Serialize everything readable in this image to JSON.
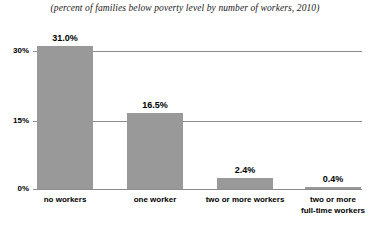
{
  "chart_data": {
    "type": "bar",
    "title": "(percent of families below poverty level by number of workers, 2010)",
    "xlabel": "",
    "ylabel": "",
    "categories": [
      "no workers",
      "one worker",
      "two or more workers",
      "two or more full-time workers"
    ],
    "category_lines": [
      [
        "no workers"
      ],
      [
        "one worker"
      ],
      [
        "two or more workers"
      ],
      [
        "two or more",
        "full-time workers"
      ]
    ],
    "values": [
      31.0,
      16.5,
      2.4,
      0.4
    ],
    "value_labels": [
      "31.0%",
      "16.5%",
      "2.4%",
      "0.4%"
    ],
    "ylim": [
      0,
      30
    ],
    "yticks": [
      0,
      15,
      30
    ],
    "ytick_labels": [
      "0%",
      "15%",
      "30%"
    ],
    "grid": true,
    "legend": "none",
    "colors": {
      "bar_fill": "#999999",
      "axis": "#8c8c8c",
      "text": "#000000",
      "background": "#ffffff"
    }
  }
}
